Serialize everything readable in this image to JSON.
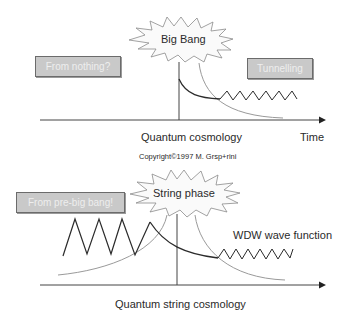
{
  "top_diagram": {
    "burst_label": "Big Bang",
    "left_box": "From nothing?",
    "right_box": "Tunnelling",
    "caption": "Quantum cosmology",
    "axis_label": "Time"
  },
  "copyright": "Copyright©1997 M. Grsp+rini",
  "bottom_diagram": {
    "burst_label": "String phase",
    "left_box": "From pre-big bang!",
    "curve_label": "WDW wave function",
    "caption": "Quantum string cosmology"
  },
  "colors": {
    "dark_line": "#2b2b2b",
    "light_curve": "#9a9a9a",
    "box_fill": "#c9c9c9",
    "box_border": "#6b6b6b",
    "box_text": "#eeeeee"
  }
}
